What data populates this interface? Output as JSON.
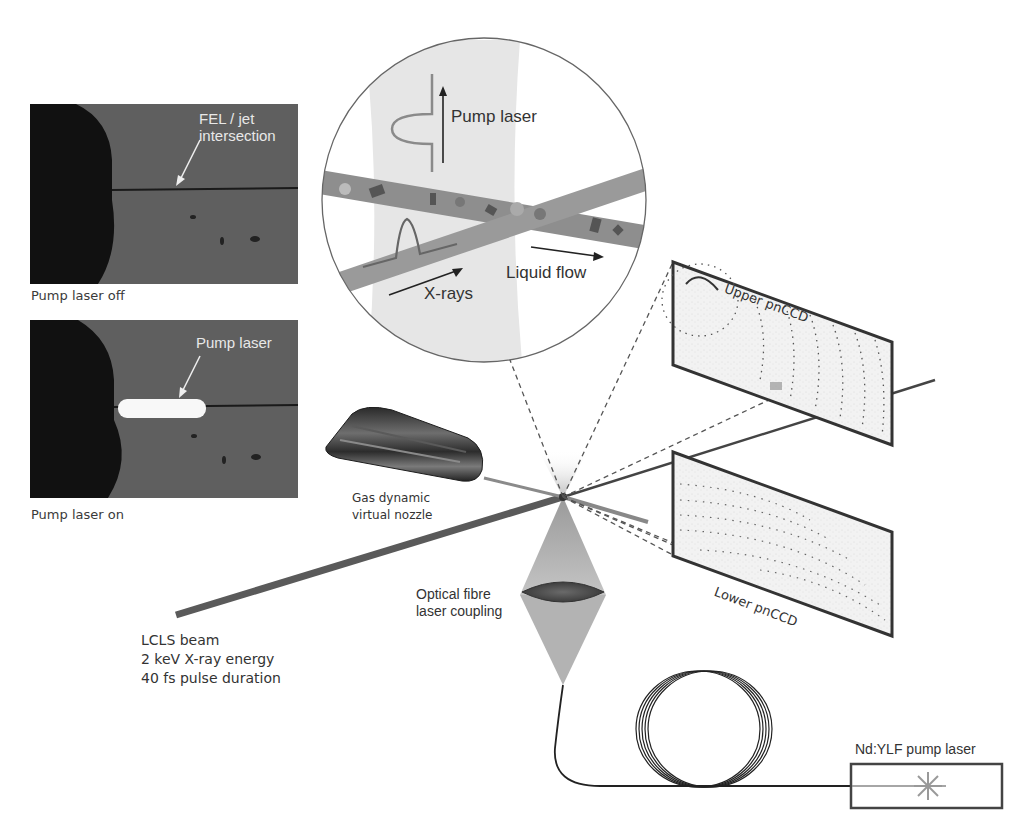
{
  "photos": {
    "top": {
      "annotation": "FEL / jet intersection",
      "annotation_line1": "FEL / jet",
      "annotation_line2": "intersection",
      "caption": "Pump laser off"
    },
    "bottom": {
      "annotation": "Pump laser",
      "caption": "Pump laser on"
    }
  },
  "inset": {
    "pump_laser_label": "Pump laser",
    "liquid_flow_label": "Liquid flow",
    "xrays_label": "X-rays"
  },
  "detectors": {
    "upper": "Upper pnCCD",
    "lower": "Lower pnCCD"
  },
  "nozzle": {
    "label_line1": "Gas dynamic",
    "label_line2": "virtual nozzle"
  },
  "fibre": {
    "label_line1": "Optical fibre",
    "label_line2": "laser coupling"
  },
  "beam": {
    "line1": "LCLS beam",
    "line2": "2 keV X-ray energy",
    "line3": "40 fs pulse duration"
  },
  "laser": {
    "label": "Nd:YLF pump laser"
  },
  "colors": {
    "photo_bg": "#5f5f5f",
    "beam": "#555555",
    "outline": "#333333",
    "cone": "#a8a8a8"
  }
}
